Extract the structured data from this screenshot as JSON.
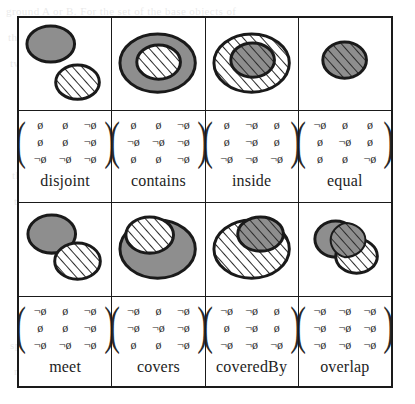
{
  "figure": {
    "caption_present": false,
    "symbols": {
      "empty": "ø",
      "not_empty": "¬ø"
    },
    "colors": {
      "ink": "#1a1a1a",
      "gray_fill": "#8e8e8e",
      "hatch": "#2b2b2b",
      "paper": "#ffffff"
    },
    "cells": [
      {
        "name": "disjoint",
        "label": "disjoint",
        "matrix": [
          [
            "ø",
            "ø",
            "¬ø"
          ],
          [
            "ø",
            "ø",
            "¬ø"
          ],
          [
            "¬ø",
            "¬ø",
            "¬ø"
          ]
        ]
      },
      {
        "name": "contains",
        "label": "contains",
        "matrix": [
          [
            "ø",
            "ø",
            "¬ø"
          ],
          [
            "¬ø",
            "¬ø",
            "¬ø"
          ],
          [
            "ø",
            "ø",
            "¬ø"
          ]
        ]
      },
      {
        "name": "inside",
        "label": "inside",
        "matrix": [
          [
            "ø",
            "¬ø",
            "ø"
          ],
          [
            "ø",
            "¬ø",
            "ø"
          ],
          [
            "¬ø",
            "¬ø",
            "¬ø"
          ]
        ]
      },
      {
        "name": "equal",
        "label": "equal",
        "matrix": [
          [
            "¬ø",
            "ø",
            "ø"
          ],
          [
            "ø",
            "¬ø",
            "ø"
          ],
          [
            "ø",
            "ø",
            "¬ø"
          ]
        ]
      },
      {
        "name": "meet",
        "label": "meet",
        "matrix": [
          [
            "¬ø",
            "ø",
            "¬ø"
          ],
          [
            "ø",
            "ø",
            "¬ø"
          ],
          [
            "¬ø",
            "¬ø",
            "¬ø"
          ]
        ]
      },
      {
        "name": "covers",
        "label": "covers",
        "matrix": [
          [
            "¬ø",
            "ø",
            "¬ø"
          ],
          [
            "¬ø",
            "¬ø",
            "¬ø"
          ],
          [
            "ø",
            "ø",
            "¬ø"
          ]
        ]
      },
      {
        "name": "coveredBy",
        "label": "coveredBy",
        "matrix": [
          [
            "¬ø",
            "¬ø",
            "ø"
          ],
          [
            "ø",
            "¬ø",
            "ø"
          ],
          [
            "¬ø",
            "¬ø",
            "¬ø"
          ]
        ]
      },
      {
        "name": "overlap",
        "label": "overlap",
        "matrix": [
          [
            "¬ø",
            "¬ø",
            "¬ø"
          ],
          [
            "¬ø",
            "¬ø",
            "¬ø"
          ],
          [
            "¬ø",
            "¬ø",
            "¬ø"
          ]
        ]
      }
    ]
  }
}
